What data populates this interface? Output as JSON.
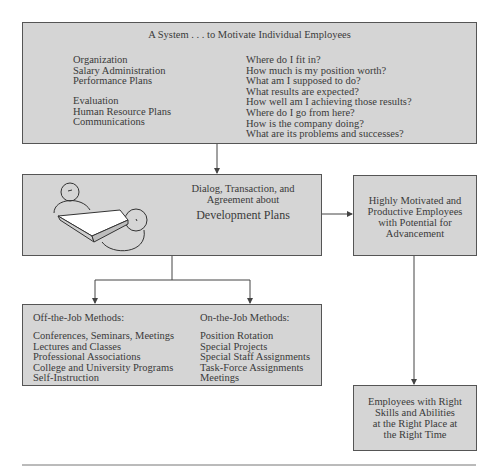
{
  "top_box": {
    "title": "A System . . . to Motivate Individual Employees",
    "left_group1": [
      "Organization",
      "Salary Administration",
      "Performance Plans"
    ],
    "left_group2": [
      "Evaluation",
      "Human Resource Plans",
      "Communications"
    ],
    "questions": [
      "Where do I fit in?",
      "How much is my position worth?",
      "What am I supposed to do?",
      "What results are expected?",
      "How well am I achieving those results?",
      "Where do I go from here?",
      "How is the company doing?",
      "What are its problems and successes?"
    ]
  },
  "middle_box": {
    "line1": "Dialog, Transaction, and",
    "line2": "Agreement about",
    "heading": "Development Plans",
    "illustration": "two-people-at-table-icon"
  },
  "right_box": {
    "lines": [
      "Highly Motivated and",
      "Productive Employees",
      "with Potential for",
      "Advancement"
    ]
  },
  "methods_box": {
    "off_job": {
      "heading": "Off-the-Job Methods:",
      "items": [
        "Conferences, Seminars, Meetings",
        "Lectures and Classes",
        "Professional Associations",
        "College and University Programs",
        "Self-Instruction"
      ]
    },
    "on_job": {
      "heading": "On-the-Job Methods:",
      "items": [
        "Position Rotation",
        "Special Projects",
        "Special Staff Assignments",
        "Task-Force Assignments",
        "Meetings"
      ]
    }
  },
  "outcome_box": {
    "lines": [
      "Employees with Right",
      "Skills and Abilities",
      "at the Right Place at",
      "the Right Time"
    ]
  },
  "colors": {
    "box_fill": "#d5d5d5",
    "border": "#555555",
    "text": "#3a3a3a"
  }
}
